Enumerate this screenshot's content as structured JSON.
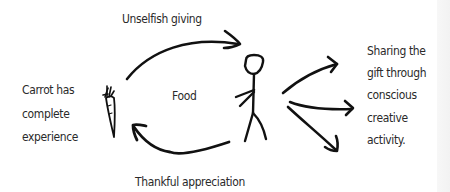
{
  "diagram": {
    "top_arrow_label": "Unselfish giving",
    "bottom_arrow_label": "Thankful appreciation",
    "center_label": "Food",
    "left_text": {
      "lines": [
        "Carrot has",
        "complete",
        "experience"
      ]
    },
    "right_text": {
      "lines": [
        "Sharing the",
        "gift through",
        "conscious",
        "creative",
        "activity."
      ]
    },
    "icons": {
      "carrot": "carrot-icon",
      "person": "stick-figure-icon",
      "top_arrow": "curved-arrow-right-icon",
      "bottom_arrow": "curved-arrow-left-icon",
      "fan_arrows": [
        "arrow-up-right-icon",
        "arrow-right-icon",
        "arrow-down-right-icon"
      ]
    },
    "colors": {
      "ink": "#111111",
      "text": "#2a2a2a",
      "background": "#ffffff",
      "edge_strip": "#f4f4f4"
    }
  }
}
